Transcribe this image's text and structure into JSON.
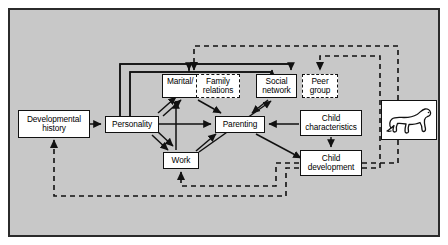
{
  "figure": {
    "background_color": "#c8c8c8",
    "border_color": "#2b2b2b",
    "node_fill": "#ffffff",
    "line_color": "#111111"
  },
  "nodes": [
    {
      "id": "developmental-history",
      "label": "Developmental history",
      "style": "solid",
      "x": 18,
      "y": 110,
      "w": 72,
      "h": 28
    },
    {
      "id": "personality",
      "label": "Personality",
      "style": "solid",
      "x": 105,
      "y": 116,
      "w": 54,
      "h": 17
    },
    {
      "id": "marital",
      "label": "Marital/",
      "style": "solid",
      "x": 162,
      "y": 74,
      "w": 54,
      "h": 24
    },
    {
      "id": "family-relations",
      "label": "Family relations",
      "style": "dashed",
      "x": 196,
      "y": 74,
      "w": 44,
      "h": 24
    },
    {
      "id": "social-network",
      "label": "Social network",
      "style": "solid",
      "x": 256,
      "y": 74,
      "w": 41,
      "h": 24
    },
    {
      "id": "peer-group",
      "label": "Peer group",
      "style": "dashed",
      "x": 302,
      "y": 74,
      "w": 36,
      "h": 24
    },
    {
      "id": "parenting",
      "label": "Parenting",
      "style": "solid",
      "x": 215,
      "y": 116,
      "w": 50,
      "h": 17
    },
    {
      "id": "child-characteristics",
      "label": "Child characteristics",
      "style": "solid",
      "x": 300,
      "y": 110,
      "w": 62,
      "h": 26
    },
    {
      "id": "child-development",
      "label": "Child development",
      "style": "solid",
      "x": 300,
      "y": 150,
      "w": 62,
      "h": 26
    },
    {
      "id": "work",
      "label": "Work",
      "style": "solid",
      "x": 163,
      "y": 152,
      "w": 36,
      "h": 17
    }
  ],
  "illustration": {
    "id": "dog-illustration",
    "name": "dog-line-drawing",
    "x": 381,
    "y": 100,
    "w": 56,
    "h": 40
  },
  "edges": [
    {
      "from": "developmental-history",
      "to": "personality",
      "style": "solid"
    },
    {
      "from": "personality",
      "to": "parenting",
      "style": "solid"
    },
    {
      "from": "personality",
      "to": "marital",
      "style": "solid"
    },
    {
      "from": "personality",
      "to": "work",
      "style": "solid"
    },
    {
      "from": "marital",
      "to": "parenting",
      "style": "solid"
    },
    {
      "from": "social-network",
      "to": "parenting",
      "style": "solid"
    },
    {
      "from": "work",
      "to": "parenting",
      "style": "solid"
    },
    {
      "from": "work",
      "to": "marital",
      "style": "solid"
    },
    {
      "from": "work",
      "to": "social-network",
      "style": "solid"
    },
    {
      "from": "child-characteristics",
      "to": "parenting",
      "style": "solid"
    },
    {
      "from": "parenting",
      "to": "child-development",
      "style": "solid"
    },
    {
      "from": "child-characteristics",
      "to": "child-development",
      "style": "solid"
    },
    {
      "from": "personality-loop-top",
      "to": "marital",
      "style": "solid"
    },
    {
      "from": "personality-loop-top",
      "to": "social-network",
      "style": "solid"
    },
    {
      "from": "child-development",
      "to": "developmental-history",
      "style": "dashed"
    },
    {
      "from": "child-development",
      "to": "work",
      "style": "dashed"
    },
    {
      "from": "child-development",
      "to": "family-relations",
      "style": "dashed"
    },
    {
      "from": "child-development",
      "to": "peer-group",
      "style": "dashed"
    }
  ]
}
